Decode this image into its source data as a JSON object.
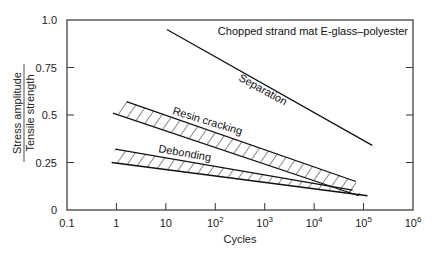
{
  "chart_data": {
    "type": "line",
    "title": "Chopped strand mat E-glass–polyester",
    "xlabel": "Cycles",
    "ylabel_numerator": "Stress amplitude",
    "ylabel_denominator": "Tensile strength",
    "xscale": "log",
    "xlim": [
      0.1,
      1000000
    ],
    "ylim": [
      0,
      1.0
    ],
    "grid": false,
    "x_ticks": [
      {
        "value": 0.1,
        "label": "0.1",
        "base": "",
        "exp": ""
      },
      {
        "value": 1,
        "label": "1",
        "base": "",
        "exp": ""
      },
      {
        "value": 10,
        "label": "10",
        "base": "",
        "exp": ""
      },
      {
        "value": 100,
        "label": "",
        "base": "10",
        "exp": "2"
      },
      {
        "value": 1000,
        "label": "",
        "base": "10",
        "exp": "3"
      },
      {
        "value": 10000,
        "label": "",
        "base": "10",
        "exp": "4"
      },
      {
        "value": 100000,
        "label": "",
        "base": "10",
        "exp": "5"
      },
      {
        "value": 1000000,
        "label": "",
        "base": "10",
        "exp": "6"
      }
    ],
    "y_ticks": [
      {
        "value": 0,
        "label": "0"
      },
      {
        "value": 0.25,
        "label": "0.25"
      },
      {
        "value": 0.5,
        "label": "0.5"
      },
      {
        "value": 0.75,
        "label": "0.75"
      },
      {
        "value": 1.0,
        "label": "1.0"
      }
    ],
    "series": [
      {
        "name": "Separation",
        "kind": "line",
        "x": [
          10.5,
          150000
        ],
        "y": [
          0.95,
          0.34
        ]
      },
      {
        "name": "Resin cracking",
        "kind": "band",
        "upper": {
          "x": [
            1.6,
            70000
          ],
          "y": [
            0.57,
            0.15
          ]
        },
        "lower": {
          "x": [
            0.85,
            80000
          ],
          "y": [
            0.51,
            0.075
          ]
        }
      },
      {
        "name": "Debonding",
        "kind": "band",
        "upper": {
          "x": [
            0.95,
            60000
          ],
          "y": [
            0.32,
            0.105
          ]
        },
        "lower": {
          "x": [
            0.8,
            120000
          ],
          "y": [
            0.25,
            0.075
          ]
        }
      }
    ],
    "annotations": [
      {
        "text": "Separation",
        "series": "Separation"
      },
      {
        "text": "Resin cracking",
        "series": "Resin cracking"
      },
      {
        "text": "Debonding",
        "series": "Debonding"
      }
    ]
  }
}
